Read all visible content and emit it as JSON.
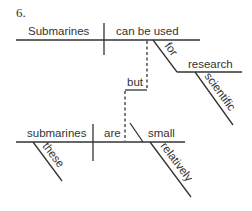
{
  "diagram": {
    "number": "6.",
    "type": "sentence-diagram",
    "clause_1": {
      "subject": "Submarines",
      "verb": "can be used",
      "prepositional_phrase": {
        "preposition": "for",
        "object": "research",
        "modifier": "scientific"
      }
    },
    "conjunction": "but",
    "clause_2": {
      "subject": "submarines",
      "subject_modifier": "these",
      "verb": "are",
      "predicate_adjective": "small",
      "adjective_modifier": "relatively"
    },
    "line_color": "#333333"
  }
}
